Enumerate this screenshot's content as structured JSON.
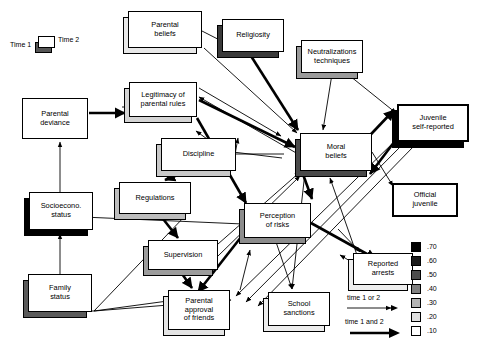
{
  "figure": {
    "time_legend": {
      "left_label": "Time 1",
      "right_label": "Time 2"
    },
    "arrow_legend": [
      {
        "label": "time 1 or 2",
        "style": "thin"
      },
      {
        "label": "time 1 and 2",
        "style": "thick"
      }
    ],
    "strength_legend": {
      "values": [
        ".70",
        ".60",
        ".50",
        ".40",
        ".30",
        ".20",
        ".10"
      ],
      "colors": [
        "#000000",
        "#1c1c1c",
        "#4d4d4d",
        "#808080",
        "#b3b3b3",
        "#e0e0e0",
        "#ffffff"
      ]
    }
  },
  "nodes": [
    {
      "id": "parental-beliefs",
      "label": "Parental\nbeliefs",
      "x": 128,
      "y": 11,
      "w": 74,
      "h": 37,
      "shadow": "#e8e8e8",
      "thick": false
    },
    {
      "id": "religiosity",
      "label": "Religiosity",
      "x": 222,
      "y": 19,
      "w": 62,
      "h": 33,
      "shadow": "#3a3a3a",
      "thick": false
    },
    {
      "id": "neutralizations",
      "label": "Neutralizations\ntechniques",
      "x": 301,
      "y": 40,
      "w": 62,
      "h": 33,
      "shadow": "#9a9a9a",
      "thick": false
    },
    {
      "id": "legitimacy",
      "label": "Legitimacy of\nparental rules",
      "x": 129,
      "y": 82,
      "w": 68,
      "h": 35,
      "shadow": "#d4d4d4",
      "thick": false
    },
    {
      "id": "parental-deviance",
      "label": "Parental\ndeviance",
      "x": 22,
      "y": 98,
      "w": 66,
      "h": 41,
      "shadow": null,
      "thick": false
    },
    {
      "id": "juvenile-self-reported",
      "label": "Juvenile\nself-reported",
      "x": 397,
      "y": 104,
      "w": 72,
      "h": 38,
      "shadow": "#000000",
      "thick": true
    },
    {
      "id": "moral-beliefs",
      "label": "Moral\nbeliefs",
      "x": 300,
      "y": 133,
      "w": 72,
      "h": 38,
      "shadow": "#4a4a4a",
      "thick": false
    },
    {
      "id": "discipline",
      "label": "Discipline",
      "x": 161,
      "y": 138,
      "w": 75,
      "h": 33,
      "shadow": "#c8c8c8",
      "thick": false
    },
    {
      "id": "regulations",
      "label": "Regulations",
      "x": 119,
      "y": 182,
      "w": 72,
      "h": 32,
      "shadow": "#bdbdbd",
      "thick": false
    },
    {
      "id": "official-juvenile",
      "label": "Official\njuvenile",
      "x": 392,
      "y": 183,
      "w": 66,
      "h": 34,
      "shadow": null,
      "thick": true
    },
    {
      "id": "socioeconomic-status",
      "label": "Socioecono.\nstatus",
      "x": 29,
      "y": 192,
      "w": 64,
      "h": 38,
      "shadow": "#000000",
      "thick": false
    },
    {
      "id": "perception-of-risks",
      "label": "Perception\nof risks",
      "x": 244,
      "y": 203,
      "w": 67,
      "h": 35,
      "shadow": "#8c8c8c",
      "thick": false
    },
    {
      "id": "supervision",
      "label": "Supervision",
      "x": 148,
      "y": 240,
      "w": 70,
      "h": 30,
      "shadow": "#9c9c9c",
      "thick": false
    },
    {
      "id": "reported-arrests",
      "label": "Reported\narrests",
      "x": 353,
      "y": 253,
      "w": 60,
      "h": 32,
      "shadow": "#eeeeee",
      "thick": false
    },
    {
      "id": "family-status",
      "label": "Family\nstatus",
      "x": 28,
      "y": 274,
      "w": 64,
      "h": 38,
      "shadow": "#5a5a5a",
      "thick": false
    },
    {
      "id": "parental-approval",
      "label": "Parental\napproval\nof friends",
      "x": 168,
      "y": 290,
      "w": 62,
      "h": 40,
      "shadow": "#e4e4e4",
      "thick": false
    },
    {
      "id": "school-sanctions",
      "label": "School\nsanctions",
      "x": 268,
      "y": 292,
      "w": 62,
      "h": 34,
      "shadow": "#ececec",
      "thick": false
    }
  ],
  "edges": [
    {
      "from": "parental-deviance",
      "to": "legitimacy",
      "style": "thick"
    },
    {
      "from": "parental-beliefs",
      "to": "moral-beliefs",
      "style": "thin"
    },
    {
      "from": "religiosity",
      "to": "moral-beliefs",
      "style": "thick"
    },
    {
      "from": "neutralizations",
      "to": "moral-beliefs",
      "style": "thin"
    },
    {
      "from": "neutralizations",
      "to": "juvenile-self-reported",
      "style": "thin"
    },
    {
      "from": "legitimacy",
      "to": "religiosity",
      "style": "thin"
    },
    {
      "from": "legitimacy",
      "to": "moral-beliefs",
      "style": "thin"
    },
    {
      "from": "legitimacy",
      "to": "perception-of-risks",
      "style": "thick"
    },
    {
      "from": "moral-beliefs",
      "to": "legitimacy",
      "style": "thin"
    },
    {
      "from": "moral-beliefs",
      "to": "juvenile-self-reported",
      "style": "thick"
    },
    {
      "from": "moral-beliefs",
      "to": "official-juvenile",
      "style": "thin"
    },
    {
      "from": "moral-beliefs",
      "to": "perception-of-risks",
      "style": "thick"
    },
    {
      "from": "moral-beliefs",
      "to": "school-sanctions",
      "style": "thin"
    },
    {
      "from": "moral-beliefs",
      "to": "discipline",
      "style": "thin"
    },
    {
      "from": "discipline",
      "to": "regulations",
      "style": "thick"
    },
    {
      "from": "regulations",
      "to": "supervision",
      "style": "thick"
    },
    {
      "from": "supervision",
      "to": "parental-approval",
      "style": "thick"
    },
    {
      "from": "socioeconomic-status",
      "to": "parental-deviance",
      "style": "thin"
    },
    {
      "from": "family-status",
      "to": "socioeconomic-status",
      "style": "thin"
    },
    {
      "from": "family-status",
      "to": "regulations",
      "style": "thin"
    },
    {
      "from": "family-status",
      "to": "parental-approval",
      "style": "thin"
    },
    {
      "from": "perception-of-risks",
      "to": "juvenile-self-reported",
      "style": "thick"
    },
    {
      "from": "perception-of-risks",
      "to": "parental-approval",
      "style": "thick"
    },
    {
      "from": "perception-of-risks",
      "to": "school-sanctions",
      "style": "thin"
    },
    {
      "from": "perception-of-risks",
      "to": "reported-arrests",
      "style": "thin"
    },
    {
      "from": "juvenile-self-reported",
      "to": "reported-arrests",
      "style": "thick"
    },
    {
      "from": "juvenile-self-reported",
      "to": "parental-approval",
      "style": "thin"
    },
    {
      "from": "reported-arrests",
      "to": "moral-beliefs",
      "style": "thin"
    }
  ]
}
